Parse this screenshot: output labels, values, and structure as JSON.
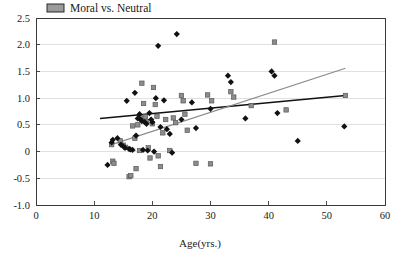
{
  "chart_data": {
    "type": "scatter",
    "title": "",
    "xlabel": "Age(yrs.)",
    "ylabel": "",
    "xlim": [
      0,
      60
    ],
    "ylim": [
      -1.0,
      2.5
    ],
    "xticks": [
      0,
      10,
      20,
      30,
      40,
      50,
      60
    ],
    "xtick_labels": [
      "0",
      "10",
      "20",
      "30",
      "40",
      "50",
      "60"
    ],
    "yticks": [
      -1.0,
      -0.5,
      0,
      0.5,
      1.0,
      1.5,
      2.0,
      2.5
    ],
    "ytick_labels": [
      "-1.0",
      "-0.5",
      "0",
      "0.5",
      "1.0",
      "1.5",
      "2.0",
      "2.5"
    ],
    "grid": "horizontal",
    "legend_position": "top-left-outside",
    "legend": [
      {
        "name": "Moral vs. Neutral",
        "marker": "square",
        "color": "#9a9a9a",
        "edge": "#2b2b2b"
      }
    ],
    "series": [
      {
        "name": "Moral",
        "marker": "diamond",
        "color": "#111111",
        "points": [
          [
            12.3,
            -0.25
          ],
          [
            13.0,
            0.17
          ],
          [
            13.2,
            0.22
          ],
          [
            14.0,
            0.25
          ],
          [
            14.6,
            0.13
          ],
          [
            15.0,
            0.1
          ],
          [
            15.3,
            0.07
          ],
          [
            15.6,
            0.95
          ],
          [
            16.0,
            0.05
          ],
          [
            16.2,
            0.04
          ],
          [
            16.6,
            0.03
          ],
          [
            17.0,
            1.1
          ],
          [
            17.2,
            0.3
          ],
          [
            17.5,
            0.62
          ],
          [
            17.8,
            0.7
          ],
          [
            18.0,
            0.6
          ],
          [
            18.2,
            0.57
          ],
          [
            18.4,
            0.03
          ],
          [
            18.7,
            0.55
          ],
          [
            19.0,
            0.52
          ],
          [
            19.2,
            0.02
          ],
          [
            19.5,
            0.72
          ],
          [
            19.8,
            0.6
          ],
          [
            20.0,
            0.55
          ],
          [
            20.3,
            0.0
          ],
          [
            20.6,
            1.0
          ],
          [
            21.0,
            1.98
          ],
          [
            21.4,
            0.46
          ],
          [
            22.0,
            0.96
          ],
          [
            22.5,
            0.42
          ],
          [
            23.0,
            0.33
          ],
          [
            23.4,
            -0.02
          ],
          [
            24.2,
            2.2
          ],
          [
            25.0,
            0.6
          ],
          [
            26.8,
            0.92
          ],
          [
            27.5,
            0.44
          ],
          [
            30.0,
            0.8
          ],
          [
            33.0,
            1.42
          ],
          [
            33.5,
            1.3
          ],
          [
            36.0,
            0.62
          ],
          [
            40.5,
            1.5
          ],
          [
            41.0,
            1.42
          ],
          [
            41.5,
            0.72
          ],
          [
            45.0,
            0.2
          ],
          [
            53.0,
            0.47
          ]
        ]
      },
      {
        "name": "Neutral",
        "marker": "square",
        "color": "#8c8c8c",
        "points": [
          [
            13.0,
            0.13
          ],
          [
            13.2,
            -0.18
          ],
          [
            13.4,
            -0.22
          ],
          [
            14.5,
            0.2
          ],
          [
            15.0,
            0.12
          ],
          [
            15.4,
            0.08
          ],
          [
            16.0,
            -0.47
          ],
          [
            16.3,
            -0.45
          ],
          [
            16.6,
            0.48
          ],
          [
            17.0,
            0.25
          ],
          [
            17.2,
            -0.32
          ],
          [
            17.5,
            0.5
          ],
          [
            17.8,
            0.02
          ],
          [
            18.0,
            0.63
          ],
          [
            18.2,
            1.28
          ],
          [
            18.5,
            0.9
          ],
          [
            18.8,
            0.65
          ],
          [
            19.0,
            0.56
          ],
          [
            19.3,
            0.07
          ],
          [
            19.6,
            -0.12
          ],
          [
            20.0,
            0.52
          ],
          [
            20.2,
            1.2
          ],
          [
            20.5,
            0.88
          ],
          [
            20.8,
            0.66
          ],
          [
            21.0,
            -0.08
          ],
          [
            21.4,
            -0.28
          ],
          [
            21.8,
            0.35
          ],
          [
            22.3,
            0.6
          ],
          [
            23.0,
            0.02
          ],
          [
            23.6,
            0.63
          ],
          [
            24.0,
            0.54
          ],
          [
            25.0,
            1.05
          ],
          [
            25.3,
            0.95
          ],
          [
            25.6,
            0.7
          ],
          [
            26.0,
            0.4
          ],
          [
            27.5,
            -0.22
          ],
          [
            29.5,
            1.06
          ],
          [
            30.0,
            -0.23
          ],
          [
            30.2,
            0.95
          ],
          [
            33.5,
            1.12
          ],
          [
            34.0,
            1.02
          ],
          [
            37.0,
            0.86
          ],
          [
            41.0,
            2.05
          ],
          [
            43.0,
            0.78
          ],
          [
            53.2,
            1.05
          ]
        ]
      }
    ],
    "trendlines": [
      {
        "name": "Moral trend",
        "color": "#111111",
        "x0": 11.0,
        "y0": 0.62,
        "x1": 53.2,
        "y1": 1.05
      },
      {
        "name": "Neutral trend",
        "color": "#8a8a8a",
        "x0": 13.0,
        "y0": 0.13,
        "x1": 53.2,
        "y1": 1.56
      }
    ]
  }
}
